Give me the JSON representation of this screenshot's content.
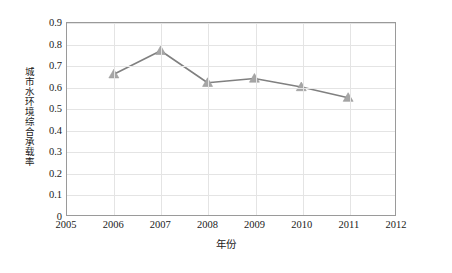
{
  "chart_data": {
    "type": "line",
    "title": "",
    "subtitle": "",
    "xlabel": "年份",
    "ylabel": "城市水环境综合承载率",
    "x": [
      2006,
      2007,
      2008,
      2009,
      2010,
      2011
    ],
    "values": [
      0.66,
      0.77,
      0.62,
      0.64,
      0.6,
      0.55
    ],
    "series": [
      {
        "name": "城市水环境综合承载率",
        "values": [
          0.66,
          0.77,
          0.62,
          0.64,
          0.6,
          0.55
        ]
      }
    ],
    "xlim": [
      2005,
      2012
    ],
    "ylim": [
      0,
      0.9
    ],
    "x_ticks": [
      "2005",
      "2006",
      "2007",
      "2008",
      "2009",
      "2010",
      "2011",
      "2012"
    ],
    "x_tick_values": [
      2005,
      2006,
      2007,
      2008,
      2009,
      2010,
      2011,
      2012
    ],
    "y_ticks": [
      "0",
      "0.1",
      "0.2",
      "0.3",
      "0.4",
      "0.5",
      "0.6",
      "0.7",
      "0.8",
      "0.9"
    ],
    "y_tick_values": [
      0,
      0.1,
      0.2,
      0.3,
      0.4,
      0.5,
      0.6,
      0.7,
      0.8,
      0.9
    ],
    "grid": {
      "horizontal": true,
      "vertical": true
    },
    "legend": {
      "visible": false,
      "position": "none"
    },
    "marker": "triangle",
    "colors": {
      "line": "#808080",
      "marker": "#a6a6a6",
      "marker_edge": "#9a9a9a",
      "gridline": "#e4e4e4",
      "plot_border": "#9a9a9a",
      "text": "#1a1a1a",
      "background": "#ffffff"
    }
  }
}
